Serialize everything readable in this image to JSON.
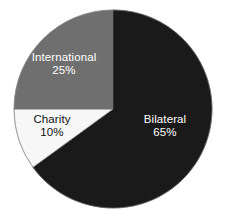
{
  "chart_data": {
    "type": "pie",
    "title": "",
    "subtitle": "",
    "xlabel": "",
    "ylabel": "",
    "categories": [
      "Bilateral",
      "International",
      "Charity"
    ],
    "values": [
      65,
      25,
      10
    ],
    "value_unit": "%",
    "legend": "none",
    "grid": false,
    "start_angle_deg": 0,
    "direction": "clockwise",
    "slices": [
      {
        "label": "Bilateral",
        "value": 65,
        "value_text": "65%",
        "color": "#1a1a1a",
        "text_color": "#ffffff",
        "start_angle_deg": 0,
        "end_angle_deg": 234
      },
      {
        "label": "Charity",
        "value": 10,
        "value_text": "10%",
        "color": "#f7f7f7",
        "text_color": "#111111",
        "start_angle_deg": 234,
        "end_angle_deg": 270
      },
      {
        "label": "International",
        "value": 25,
        "value_text": "25%",
        "color": "#6f6f6f",
        "text_color": "#ffffff",
        "start_angle_deg": 270,
        "end_angle_deg": 360
      }
    ],
    "background_color": "#ffffff",
    "outline_color": "#8a8a8a"
  },
  "labels": {
    "bilateral": {
      "name": "Bilateral",
      "value": "65%"
    },
    "international": {
      "name": "International",
      "value": "25%"
    },
    "charity": {
      "name": "Charity",
      "value": "10%"
    }
  }
}
